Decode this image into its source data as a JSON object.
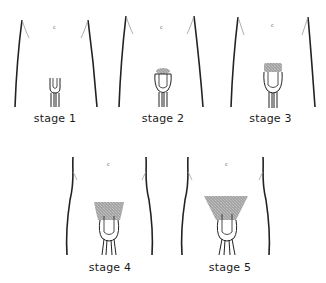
{
  "diagram": {
    "type": "illustration-series",
    "stroke_color": "#222222",
    "hair_color": "#8a8a8a",
    "panels": [
      {
        "label": "stage 1",
        "hair_extent": "none"
      },
      {
        "label": "stage 2",
        "hair_extent": "sparse at base"
      },
      {
        "label": "stage 3",
        "hair_extent": "darker, spreading over base"
      },
      {
        "label": "stage 4",
        "hair_extent": "adult type, limited area"
      },
      {
        "label": "stage 5",
        "hair_extent": "adult, extends to thighs"
      }
    ]
  }
}
